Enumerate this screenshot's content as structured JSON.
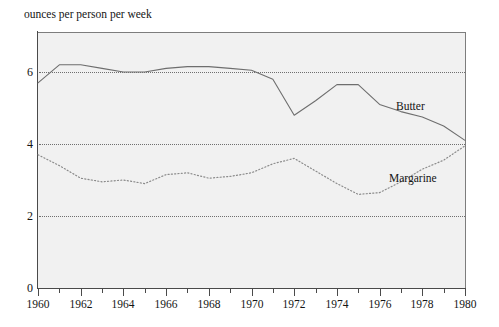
{
  "chart_data": {
    "type": "line",
    "title": "ounces per person per week",
    "xlabel": "",
    "ylabel": "ounces per person per week",
    "xlim": [
      1960,
      1980
    ],
    "ylim": [
      0,
      7.1
    ],
    "grid": "horizontal dotted gridlines at 2, 4, 6",
    "legend": "inline labels at end of each series",
    "x": [
      1960,
      1961,
      1962,
      1963,
      1964,
      1965,
      1966,
      1967,
      1968,
      1969,
      1970,
      1971,
      1972,
      1973,
      1974,
      1975,
      1976,
      1977,
      1978,
      1979,
      1980
    ],
    "xticks_major": [
      1960,
      1962,
      1964,
      1966,
      1968,
      1970,
      1972,
      1974,
      1976,
      1978,
      1980
    ],
    "xticks_minor": [
      1961,
      1963,
      1965,
      1967,
      1969,
      1971,
      1973,
      1975,
      1977,
      1979
    ],
    "xtick_labels": [
      "1960",
      "1962",
      "1964",
      "1966",
      "1968",
      "1970",
      "1972",
      "1974",
      "1976",
      "1978",
      "1980"
    ],
    "yticks": [
      0,
      2,
      4,
      6
    ],
    "ytick_labels": [
      "0",
      "2",
      "4",
      "6"
    ],
    "series": [
      {
        "name": "Butter",
        "label": "Butter",
        "style": "solid",
        "color": "#6e6e6e",
        "values": [
          5.7,
          6.2,
          6.2,
          6.1,
          6.0,
          6.0,
          6.1,
          6.15,
          6.15,
          6.1,
          6.05,
          5.8,
          4.8,
          5.2,
          5.65,
          5.65,
          5.1,
          4.9,
          4.75,
          4.5,
          4.1
        ]
      },
      {
        "name": "Margarine",
        "label": "Margarine",
        "style": "dotted",
        "color": "#8b8b8b",
        "values": [
          3.7,
          3.4,
          3.05,
          2.95,
          3.0,
          2.9,
          3.15,
          3.2,
          3.05,
          3.1,
          3.2,
          3.45,
          3.6,
          3.25,
          2.9,
          2.6,
          2.65,
          2.95,
          3.3,
          3.55,
          3.95
        ]
      }
    ]
  },
  "axes": {
    "plot_background": "#f1f1f1",
    "axis_color": "#4a4a4a",
    "gridline_color": "#6f6f6f"
  }
}
